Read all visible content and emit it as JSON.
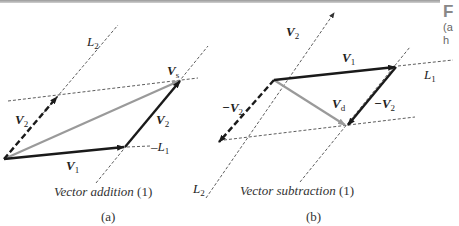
{
  "figure": {
    "panels": [
      {
        "id": "a",
        "tag": "(a)",
        "caption": "Vector addition",
        "caption_num": "(1)",
        "labels": {
          "L2": "L",
          "L2_sub": "2",
          "L1": "L",
          "L1_sub": "1",
          "Vs": "V",
          "Vs_sub": "s",
          "V2_dashed": "V",
          "V2_dashed_sub": "2",
          "V2_solid": "V",
          "V2_solid_sub": "2",
          "V1": "V",
          "V1_sub": "1"
        }
      },
      {
        "id": "b",
        "tag": "(b)",
        "caption": "Vector subtraction",
        "caption_num": "(1)",
        "labels": {
          "V2": "V",
          "V2_sub": "2",
          "V1": "V",
          "V1_sub": "1",
          "L1": "L",
          "L1_sub": "1",
          "negV2_dashed": "−V",
          "negV2_dashed_sub": "2",
          "Vd": "V",
          "Vd_sub": "d",
          "negV2_solid": "−V",
          "negV2_solid_sub": "2",
          "L2": "L",
          "L2_sub": "2"
        }
      }
    ],
    "side_text": {
      "line1": "F",
      "line2": "(a",
      "line3": "h"
    },
    "colors": {
      "vector": "#1a1a1a",
      "resultant": "#9a9a9a",
      "construction": "#333333"
    }
  }
}
